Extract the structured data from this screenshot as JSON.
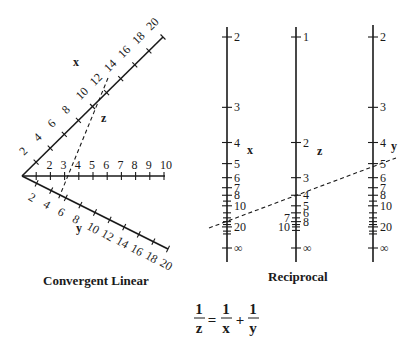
{
  "panels": {
    "convergent": {
      "caption": "Convergent Linear",
      "axes": {
        "x": {
          "label": "x",
          "ticks": [
            "2",
            "4",
            "6",
            "8",
            "10",
            "12",
            "14",
            "16",
            "18",
            "20"
          ]
        },
        "z": {
          "label": "z",
          "ticks": [
            "1",
            "2",
            "3",
            "4",
            "5",
            "6",
            "7",
            "8",
            "9",
            "10"
          ],
          "tick_labels": [
            "2",
            "3",
            "4",
            "5",
            "6",
            "7",
            "8",
            "9",
            "10"
          ]
        },
        "y": {
          "label": "y",
          "ticks": [
            "2",
            "4",
            "6",
            "8",
            "10",
            "12",
            "14",
            "16",
            "18",
            "20"
          ]
        }
      },
      "example_line": {
        "x": 12,
        "z": 4,
        "y": 6
      }
    },
    "reciprocal": {
      "caption": "Reciprocal",
      "axes": {
        "x": {
          "label": "x",
          "tick_labels": [
            "2",
            "3",
            "4",
            "5",
            "6",
            "7",
            "8",
            "10",
            "20",
            "∞"
          ]
        },
        "z": {
          "label": "z",
          "tick_labels_right": [
            "1",
            "2",
            "3",
            "4",
            "5",
            "6",
            "8",
            "∞"
          ],
          "tick_labels_left": [
            "7",
            "10"
          ]
        },
        "y": {
          "label": "y",
          "tick_labels": [
            "2",
            "3",
            "4",
            "5",
            "6",
            "7",
            "8",
            "10",
            "20",
            "∞"
          ]
        }
      },
      "example_line": {
        "x": 12,
        "z": 4,
        "y": 6
      }
    }
  },
  "equation": {
    "lhs_num": "1",
    "lhs_den": "z",
    "equals": "=",
    "t1_num": "1",
    "t1_den": "x",
    "plus": "+",
    "t2_num": "1",
    "t2_den": "y"
  },
  "chart_data": {
    "type": "nomogram",
    "title": "",
    "panels": [
      {
        "name": "Convergent Linear",
        "axes": [
          {
            "name": "x",
            "range": [
              0,
              20
            ],
            "ticks": [
              2,
              4,
              6,
              8,
              10,
              12,
              14,
              16,
              18,
              20
            ],
            "direction": "up-right"
          },
          {
            "name": "z",
            "range": [
              0,
              10
            ],
            "ticks": [
              1,
              2,
              3,
              4,
              5,
              6,
              7,
              8,
              9,
              10
            ],
            "direction": "horizontal"
          },
          {
            "name": "y",
            "range": [
              0,
              20
            ],
            "ticks": [
              2,
              4,
              6,
              8,
              10,
              12,
              14,
              16,
              18,
              20
            ],
            "direction": "down-right"
          }
        ],
        "isopleth": {
          "x": 12,
          "y": 6,
          "z": 4
        }
      },
      {
        "name": "Reciprocal",
        "axes": [
          {
            "name": "x",
            "ticks": [
              2,
              3,
              4,
              5,
              6,
              7,
              8,
              10,
              20,
              "∞"
            ]
          },
          {
            "name": "z",
            "ticks": [
              1,
              2,
              3,
              4,
              5,
              6,
              7,
              8,
              10,
              "∞"
            ]
          },
          {
            "name": "y",
            "ticks": [
              2,
              3,
              4,
              5,
              6,
              7,
              8,
              10,
              20,
              "∞"
            ]
          }
        ],
        "isopleth": {
          "x": 12,
          "y": 5.5,
          "z": 4
        }
      }
    ],
    "equation": "1/z = 1/x + 1/y"
  }
}
